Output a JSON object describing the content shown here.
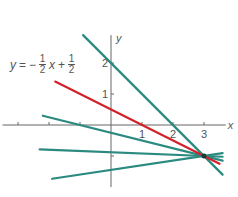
{
  "chart_data": {
    "type": "line",
    "title": "",
    "xlabel": "x",
    "ylabel": "y",
    "xlim": [
      -3.5,
      3.7
    ],
    "ylim": [
      -2.0,
      2.9
    ],
    "x_tick_labels": [
      "1",
      "2",
      "3"
    ],
    "y_tick_labels": [
      "1",
      "2"
    ],
    "x_ticks": [
      -3,
      -2,
      -1,
      1,
      2,
      3
    ],
    "y_ticks": [
      -1,
      1,
      2
    ],
    "highlight_equation": {
      "lhs": "y",
      "eq": "=",
      "sign1": "−",
      "n1": "1",
      "d1": "2",
      "var": "x",
      "sign2": "+",
      "n2": "1",
      "d2": "2"
    },
    "common_point": [
      3,
      -1
    ],
    "series": [
      {
        "name": "y = -x/2 + 1/2",
        "color": "#d4202a",
        "slope": -0.5,
        "intercept": 0.5,
        "x_range": [
          -1.8,
          3.5
        ]
      },
      {
        "name": "teal line 1",
        "color": "#2a8a80",
        "slope": -1.0,
        "intercept": 2.0,
        "x_range": [
          -0.9,
          3.6
        ]
      },
      {
        "name": "teal line 2",
        "color": "#2a8a80",
        "slope": -0.25,
        "intercept": -0.25,
        "x_range": [
          -2.2,
          3.6
        ]
      },
      {
        "name": "teal line 3",
        "color": "#2a8a80",
        "slope": -0.04,
        "intercept": -0.88,
        "x_range": [
          -2.3,
          3.6
        ]
      },
      {
        "name": "teal line 4",
        "color": "#2a8a80",
        "slope": 0.15,
        "intercept": -1.45,
        "x_range": [
          -1.9,
          3.6
        ]
      }
    ]
  }
}
